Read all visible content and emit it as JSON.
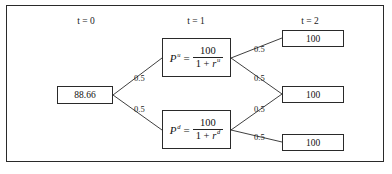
{
  "diagram": {
    "type": "binomial-interest-rate-tree",
    "headers": [
      {
        "label": "t = 0",
        "x": 86
      },
      {
        "label": "t = 1",
        "x": 196
      },
      {
        "label": "t = 2",
        "x": 310
      }
    ],
    "root": {
      "value": "88.66",
      "box": {
        "x": 57,
        "y": 86,
        "w": 56,
        "h": 18
      }
    },
    "intermediate": [
      {
        "name": "up-state-price",
        "lhs": "P",
        "lhs_sup": "u",
        "equals": "=",
        "numerator": "100",
        "den_one": "1 +",
        "den_rate": "r",
        "den_rate_sup": "u",
        "box": {
          "x": 162,
          "y": 38,
          "w": 69,
          "h": 39
        }
      },
      {
        "name": "down-state-price",
        "lhs": "P",
        "lhs_sup": "d",
        "equals": "=",
        "numerator": "100",
        "den_one": "1 +",
        "den_rate": "r",
        "den_rate_sup": "d",
        "box": {
          "x": 162,
          "y": 110,
          "w": 69,
          "h": 39
        }
      }
    ],
    "terminal": [
      {
        "value": "100",
        "box": {
          "x": 282,
          "y": 30,
          "w": 62,
          "h": 17
        }
      },
      {
        "value": "100",
        "box": {
          "x": 282,
          "y": 86,
          "w": 62,
          "h": 17
        }
      },
      {
        "value": "100",
        "box": {
          "x": 282,
          "y": 134,
          "w": 62,
          "h": 17
        }
      }
    ],
    "probabilities": [
      {
        "name": "prob-root-up",
        "text": "0.5",
        "x": 134,
        "y": 73
      },
      {
        "name": "prob-root-down",
        "text": "0.5",
        "x": 134,
        "y": 104
      },
      {
        "name": "prob-up-up",
        "text": "0.5",
        "x": 254,
        "y": 44
      },
      {
        "name": "prob-up-down",
        "text": "0.5",
        "x": 254,
        "y": 73
      },
      {
        "name": "prob-down-up",
        "text": "0.5",
        "x": 254,
        "y": 104
      },
      {
        "name": "prob-down-down",
        "text": "0.5",
        "x": 254,
        "y": 132
      }
    ],
    "edges": [
      {
        "name": "edge-root-to-up",
        "x1": 113,
        "y1": 95,
        "x2": 162,
        "y2": 58
      },
      {
        "name": "edge-root-to-down",
        "x1": 113,
        "y1": 95,
        "x2": 162,
        "y2": 130
      },
      {
        "name": "edge-up-to-terminal-1",
        "x1": 231,
        "y1": 58,
        "x2": 282,
        "y2": 38
      },
      {
        "name": "edge-up-to-terminal-2",
        "x1": 231,
        "y1": 58,
        "x2": 282,
        "y2": 94
      },
      {
        "name": "edge-down-to-terminal-2",
        "x1": 231,
        "y1": 130,
        "x2": 282,
        "y2": 94
      },
      {
        "name": "edge-down-to-terminal-3",
        "x1": 231,
        "y1": 130,
        "x2": 282,
        "y2": 142
      }
    ],
    "colors": {
      "line": "#2a2a2a",
      "text": "#111111",
      "background": "#ffffff"
    }
  }
}
